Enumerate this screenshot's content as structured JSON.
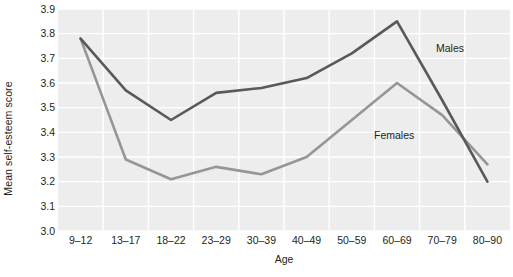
{
  "chart_data": {
    "type": "line",
    "title": "",
    "subtitle": "",
    "xlabel": "Age",
    "ylabel": "Mean self-esteem score",
    "categories": [
      "9–12",
      "13–17",
      "18–22",
      "23–29",
      "30–39",
      "40–49",
      "50–59",
      "60–69",
      "70–79",
      "80–90"
    ],
    "ylim": [
      3.0,
      3.9
    ],
    "ytick_labels": [
      "3.0",
      "3.1",
      "3.2",
      "3.3",
      "3.4",
      "3.5",
      "3.6",
      "3.7",
      "3.8",
      "3.9"
    ],
    "ytick_values": [
      3.0,
      3.1,
      3.2,
      3.3,
      3.4,
      3.5,
      3.6,
      3.7,
      3.8,
      3.9
    ],
    "grid": true,
    "grid_color": "#ffffff",
    "plot_background": "#ededed",
    "legend_position": "inline-annotation",
    "series": [
      {
        "name": "Males",
        "color": "#595959",
        "values": [
          3.78,
          3.57,
          3.45,
          3.56,
          3.58,
          3.62,
          3.72,
          3.85,
          3.53,
          3.2
        ]
      },
      {
        "name": "Females",
        "color": "#969696",
        "values": [
          3.78,
          3.29,
          3.21,
          3.26,
          3.23,
          3.3,
          3.45,
          3.6,
          3.47,
          3.27
        ]
      }
    ],
    "annotations": [
      {
        "text": "Males",
        "series": "Males",
        "color": "#231f20"
      },
      {
        "text": "Females",
        "series": "Females",
        "color": "#231f20"
      }
    ]
  }
}
